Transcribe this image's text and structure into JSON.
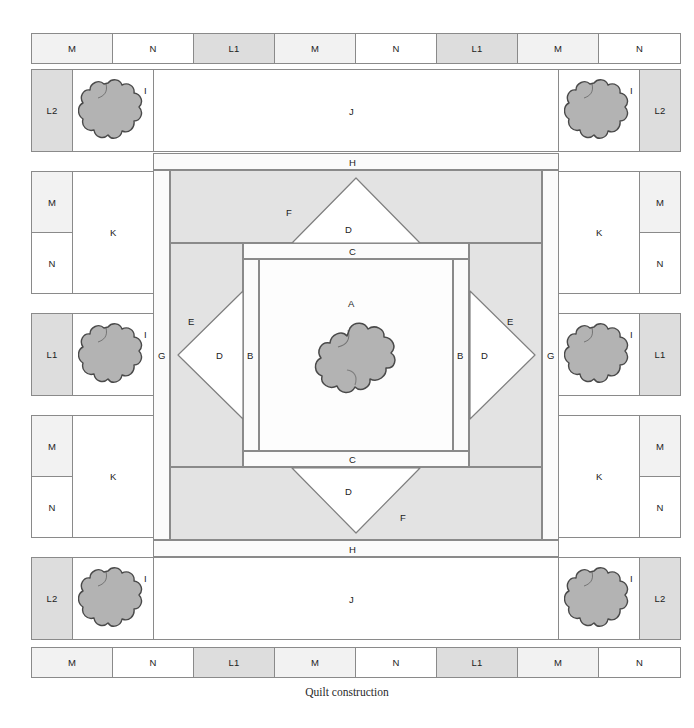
{
  "figure": {
    "caption": "Quilt construction",
    "colors": {
      "outline": "#8a8a8a",
      "flower": "#b3b3b3",
      "flower_outline": "#4a4a4a",
      "shade_mid": "#e3e3e3",
      "shade_light": "#f2f2f2",
      "l1": "#dddddd",
      "white": "#ffffff",
      "background": "#ffffff"
    }
  },
  "top_border": {
    "cells": [
      {
        "label": "M",
        "fill": "m"
      },
      {
        "label": "N",
        "fill": "w"
      },
      {
        "label": "L1",
        "fill": "l1"
      },
      {
        "label": "M",
        "fill": "m"
      },
      {
        "label": "N",
        "fill": "w"
      },
      {
        "label": "L1",
        "fill": "l1"
      },
      {
        "label": "M",
        "fill": "m"
      },
      {
        "label": "N",
        "fill": "w"
      }
    ]
  },
  "bottom_border": {
    "cells": [
      {
        "label": "M",
        "fill": "m"
      },
      {
        "label": "N",
        "fill": "w"
      },
      {
        "label": "L1",
        "fill": "l1"
      },
      {
        "label": "M",
        "fill": "m"
      },
      {
        "label": "N",
        "fill": "w"
      },
      {
        "label": "L1",
        "fill": "l1"
      },
      {
        "label": "M",
        "fill": "m"
      },
      {
        "label": "N",
        "fill": "w"
      }
    ]
  },
  "left_border": {
    "cells": [
      {
        "label": "L2",
        "fill": "l2"
      },
      {
        "label": "M",
        "fill": "m"
      },
      {
        "label": "N",
        "fill": "w"
      },
      {
        "label": "L1",
        "fill": "l1"
      },
      {
        "label": "M",
        "fill": "m"
      },
      {
        "label": "N",
        "fill": "w"
      },
      {
        "label": "L2",
        "fill": "l2"
      }
    ]
  },
  "right_border": {
    "cells": [
      {
        "label": "L2",
        "fill": "l2"
      },
      {
        "label": "M",
        "fill": "m"
      },
      {
        "label": "N",
        "fill": "w"
      },
      {
        "label": "L1",
        "fill": "l1"
      },
      {
        "label": "M",
        "fill": "m"
      },
      {
        "label": "N",
        "fill": "w"
      },
      {
        "label": "L2",
        "fill": "l2"
      }
    ]
  },
  "corner_blocks": {
    "label": "I",
    "positions": [
      "top-left",
      "top-right",
      "bottom-left",
      "bottom-right"
    ]
  },
  "side_blocks": {
    "label": "I",
    "positions": [
      "mid-left",
      "mid-right"
    ]
  },
  "sashing": {
    "j_label": "J",
    "k_label": "K",
    "j_positions": [
      "top",
      "bottom"
    ],
    "k_positions": [
      "left",
      "right"
    ]
  },
  "inner_frame": {
    "h_label": "H",
    "g_label": "G"
  },
  "center_block": {
    "a_label": "A",
    "b_label": "B",
    "c_label": "C",
    "d_label": "D",
    "e_label": "E",
    "f_label": "F"
  },
  "labels": {
    "A": "A",
    "B": "B",
    "C": "C",
    "D": "D",
    "E": "E",
    "F": "F",
    "G": "G",
    "H": "H",
    "I": "I",
    "J": "J",
    "K": "K",
    "L1": "L1",
    "L2": "L2",
    "M": "M",
    "N": "N"
  }
}
